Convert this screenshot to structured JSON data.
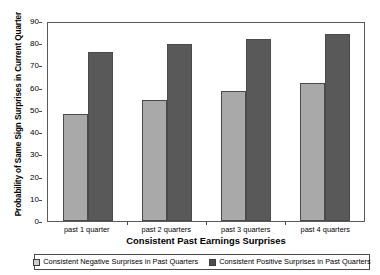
{
  "chart_data": {
    "type": "bar",
    "title": "",
    "xlabel": "Consistent Past Earnings Surprises",
    "ylabel": "Probability of Same Sign Surprises in Current Quarter",
    "categories": [
      "past 1 quarter",
      "past 2 quarters",
      "past 3 quarters",
      "past 4 quarters"
    ],
    "series": [
      {
        "name": "Consistent Negative Surprises in Past Quarters",
        "color": "#a9a9a9",
        "values": [
          48,
          54.5,
          58.5,
          62
        ]
      },
      {
        "name": "Consistent Positive Surprises in Past Quarters",
        "color": "#595959",
        "values": [
          76,
          79.5,
          82,
          84
        ]
      }
    ],
    "ylim": [
      0,
      90
    ],
    "ytick_values": [
      0,
      10,
      20,
      30,
      40,
      50,
      60,
      70,
      80,
      90
    ],
    "ytick_labels": [
      "0",
      "10",
      "20",
      "30",
      "40",
      "50",
      "60",
      "70",
      "80",
      "90"
    ],
    "grid": false,
    "legend_position": "bottom"
  },
  "legend": {
    "items": [
      {
        "label": "Consistent Negative Surprises in Past Quarters",
        "swatch": "legend-swatch-negative"
      },
      {
        "label": "Consistent Positive Surprises in Past Quarters",
        "swatch": "legend-swatch-positive"
      }
    ]
  }
}
